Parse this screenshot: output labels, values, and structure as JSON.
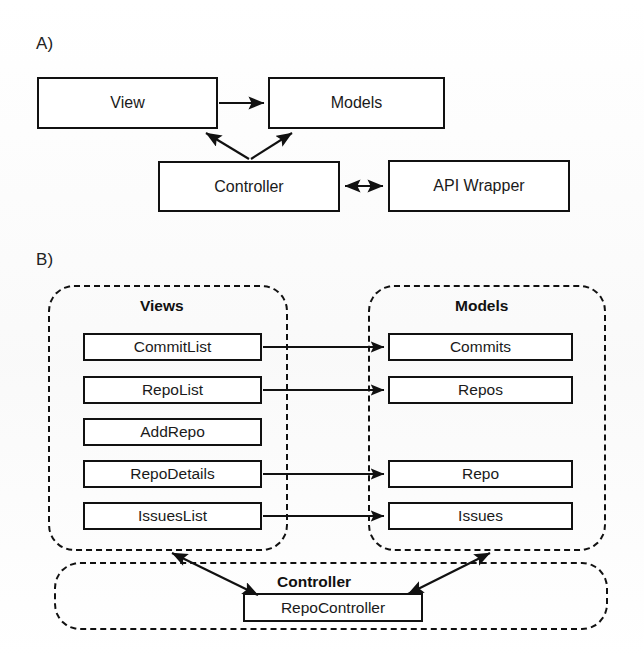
{
  "figure": {
    "panels": [
      {
        "key": "A",
        "label": "A)"
      },
      {
        "key": "B",
        "label": "B)"
      }
    ]
  },
  "panel_a": {
    "label": "A)",
    "nodes": [
      {
        "id": "view",
        "label": "View"
      },
      {
        "id": "models",
        "label": "Models"
      },
      {
        "id": "controller",
        "label": "Controller"
      },
      {
        "id": "api_wrapper",
        "label": "API Wrapper"
      }
    ],
    "edges": [
      {
        "from": "view",
        "to": "models",
        "arrow": "single"
      },
      {
        "from": "controller",
        "to": "view",
        "arrow": "single"
      },
      {
        "from": "controller",
        "to": "models",
        "arrow": "single"
      },
      {
        "from": "controller",
        "to": "api_wrapper",
        "arrow": "double"
      }
    ]
  },
  "panel_b": {
    "label": "B)",
    "groups": [
      {
        "id": "views",
        "title": "Views"
      },
      {
        "id": "models",
        "title": "Models"
      },
      {
        "id": "controller",
        "title": "Controller"
      }
    ],
    "views": [
      {
        "id": "commitlist",
        "label": "CommitList"
      },
      {
        "id": "repolist",
        "label": "RepoList"
      },
      {
        "id": "addrepo",
        "label": "AddRepo"
      },
      {
        "id": "repodetails",
        "label": "RepoDetails"
      },
      {
        "id": "issueslist",
        "label": "IssuesList"
      }
    ],
    "models": [
      {
        "id": "commits",
        "label": "Commits"
      },
      {
        "id": "repos",
        "label": "Repos"
      },
      {
        "id": "repo",
        "label": "Repo"
      },
      {
        "id": "issues",
        "label": "Issues"
      }
    ],
    "controllers": [
      {
        "id": "repocontroller",
        "label": "RepoController"
      }
    ],
    "edges": [
      {
        "from": "commitlist",
        "to": "commits",
        "arrow": "single"
      },
      {
        "from": "repolist",
        "to": "repos",
        "arrow": "single"
      },
      {
        "from": "repodetails",
        "to": "repo",
        "arrow": "single"
      },
      {
        "from": "issueslist",
        "to": "issues",
        "arrow": "single"
      },
      {
        "from": "repocontroller",
        "to": "views",
        "arrow": "double"
      },
      {
        "from": "repocontroller",
        "to": "models",
        "arrow": "double"
      }
    ]
  },
  "colors": {
    "stroke": "#111111",
    "background": "#ffffff",
    "text": "#1a1a1a"
  }
}
